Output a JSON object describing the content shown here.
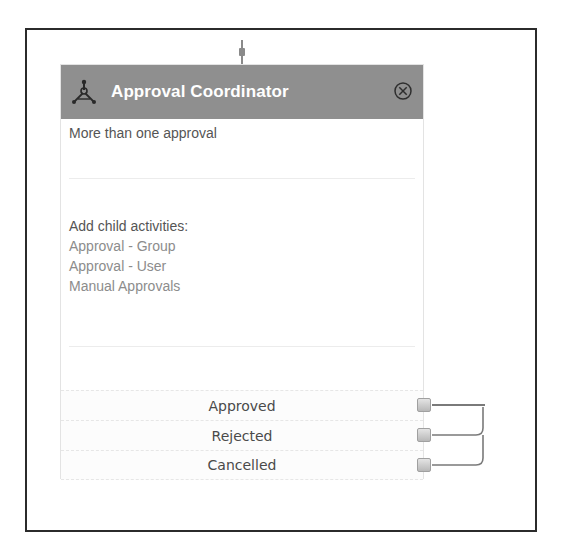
{
  "canvas": {
    "frame_color": "#2b2b2b"
  },
  "activity": {
    "title": "Approval Coordinator",
    "icon": "coordinator-fork-icon",
    "close_icon": "circle-x-icon",
    "header_color": "#8f8f8f",
    "description": "More than one approval",
    "child_activities": {
      "label": "Add child activities:",
      "items": [
        {
          "label": "Approval - Group"
        },
        {
          "label": "Approval - User"
        },
        {
          "label": "Manual Approvals"
        }
      ]
    },
    "outcomes": [
      {
        "label": "Approved",
        "port_icon": "connector-port-icon"
      },
      {
        "label": "Rejected",
        "port_icon": "connector-port-icon"
      },
      {
        "label": "Cancelled",
        "port_icon": "connector-port-icon"
      }
    ]
  }
}
